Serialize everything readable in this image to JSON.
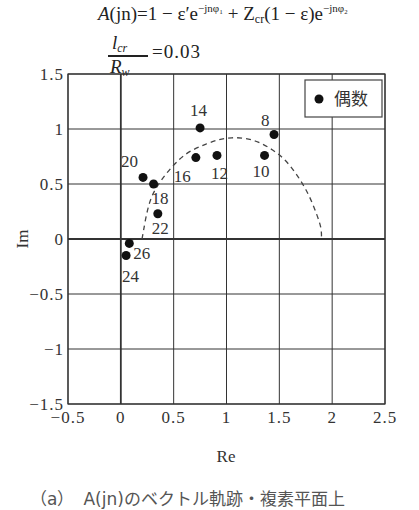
{
  "formula": {
    "lhs": "A",
    "arg": "(jn)",
    "eq": "=1 − ε′e",
    "exp1": "−jnφ₁",
    "plus": " + Z",
    "z_sub": "cr",
    "mid": "(1 − ε)e",
    "exp2": "−jnφ₂"
  },
  "ratio": {
    "num": "l",
    "num_sub": "cr",
    "den": "R",
    "den_sub": "w",
    "value_text": "=0.03"
  },
  "legend": {
    "label": "偶数",
    "marker": "filled-circle"
  },
  "caption": "（a）　A(jn)のベクトル軌跡・複素平面上",
  "chart_data": {
    "type": "scatter",
    "xlabel": "Re",
    "ylabel": "Im",
    "xlim": [
      -0.5,
      2.5
    ],
    "ylim": [
      -1.5,
      1.5
    ],
    "xticks": [
      "−0.5",
      "0",
      "0.5",
      "1",
      "1.5",
      "2",
      "2.5"
    ],
    "yticks": [
      "1.5",
      "1",
      "0.5",
      "0",
      "−0.5",
      "−1",
      "−1.5"
    ],
    "grid": true,
    "legend_position": "upper right",
    "series": [
      {
        "name": "偶数",
        "marker": "filled-circle",
        "points": [
          {
            "label": "8",
            "re": 1.45,
            "im": 0.95
          },
          {
            "label": "10",
            "re": 1.36,
            "im": 0.76
          },
          {
            "label": "12",
            "re": 0.91,
            "im": 0.76
          },
          {
            "label": "14",
            "re": 0.75,
            "im": 1.01
          },
          {
            "label": "16",
            "re": 0.71,
            "im": 0.74
          },
          {
            "label": "18",
            "re": 0.31,
            "im": 0.5
          },
          {
            "label": "20",
            "re": 0.21,
            "im": 0.56
          },
          {
            "label": "22",
            "re": 0.35,
            "im": 0.23
          },
          {
            "label": "24",
            "re": 0.05,
            "im": -0.15
          },
          {
            "label": "26",
            "re": 0.08,
            "im": -0.04
          }
        ]
      },
      {
        "name": "theoretical locus",
        "style": "dashed",
        "points_re_im": [
          [
            0.2,
            0.0
          ],
          [
            0.3,
            0.4
          ],
          [
            0.55,
            0.72
          ],
          [
            0.8,
            0.86
          ],
          [
            1.05,
            0.92
          ],
          [
            1.3,
            0.88
          ],
          [
            1.55,
            0.72
          ],
          [
            1.75,
            0.45
          ],
          [
            1.88,
            0.15
          ],
          [
            1.9,
            0.0
          ]
        ]
      }
    ]
  }
}
